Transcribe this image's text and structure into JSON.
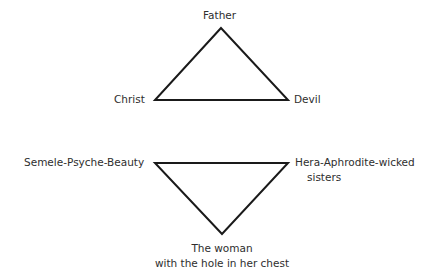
{
  "triangle_upper": {
    "top": "Father",
    "left": "Christ",
    "right": "Devil"
  },
  "triangle_lower": {
    "left": "Semele-Psyche-Beauty",
    "right_line1": "Hera-Aphrodite-wicked",
    "right_line2": "sisters",
    "bottom_line1": "The woman",
    "bottom_line2": "with the hole in her chest"
  },
  "colors": {
    "line": "#1a1a1a",
    "text": "#2e2e2e",
    "background": "#ffffff"
  }
}
